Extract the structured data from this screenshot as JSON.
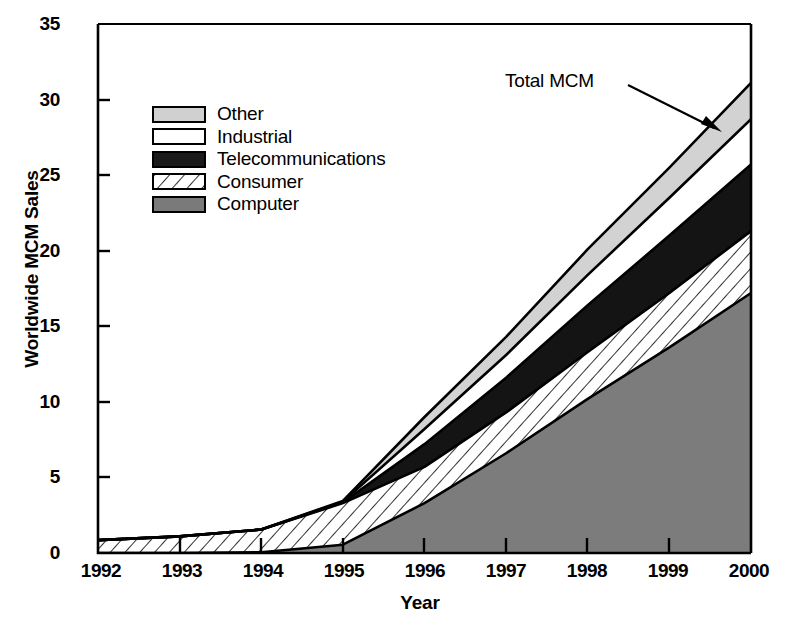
{
  "chart_data": {
    "type": "area",
    "stacked": true,
    "title": "",
    "xlabel": "Year",
    "ylabel": "Worldwide MCM Sales",
    "x": [
      1992,
      1993,
      1994,
      1995,
      1996,
      1997,
      1998,
      1999,
      2000
    ],
    "xtick_labels": [
      "1992",
      "1993",
      "1994",
      "1995",
      "1996",
      "1997",
      "1998",
      "1999",
      "2000"
    ],
    "ytick_labels": [
      "0",
      "5",
      "10",
      "15",
      "20",
      "25",
      "30",
      "35"
    ],
    "yticks": [
      0,
      5,
      10,
      15,
      20,
      25,
      30,
      35
    ],
    "ylim": [
      0,
      35
    ],
    "xlim": [
      1992,
      2000
    ],
    "grid": false,
    "legend_position": "upper-left-inside",
    "series": [
      {
        "name": "Computer",
        "swatch": "solid-gray",
        "color": "#7a7a7a",
        "values": [
          0.0,
          0.0,
          0.05,
          0.55,
          3.3,
          6.6,
          10.2,
          13.6,
          17.2
        ]
      },
      {
        "name": "Consumer",
        "swatch": "diagonal-hatch",
        "color": "#ffffff",
        "values": [
          0.85,
          1.1,
          1.5,
          2.75,
          2.4,
          2.7,
          3.1,
          3.6,
          4.1
        ]
      },
      {
        "name": "Telecommunications",
        "swatch": "solid-black",
        "color": "#1a1a1a",
        "values": [
          0.0,
          0.0,
          0.0,
          0.05,
          1.5,
          2.3,
          3.1,
          3.8,
          4.4
        ]
      },
      {
        "name": "Industrial",
        "swatch": "solid-white",
        "color": "#ffffff",
        "values": [
          0.0,
          0.0,
          0.0,
          0.05,
          1.0,
          1.5,
          2.0,
          2.5,
          3.0
        ]
      },
      {
        "name": "Other",
        "swatch": "light-gray",
        "color": "#d0d0d0",
        "values": [
          0.0,
          0.0,
          0.0,
          0.05,
          0.8,
          1.2,
          1.7,
          2.0,
          2.4
        ]
      }
    ],
    "cumulative_totals": {
      "Computer": [
        0.0,
        0.0,
        0.05,
        0.55,
        3.3,
        6.6,
        10.2,
        13.6,
        17.2
      ],
      "Consumer": [
        0.85,
        1.1,
        1.55,
        3.3,
        5.7,
        9.3,
        13.3,
        17.2,
        21.3
      ],
      "Telecommunications": [
        0.85,
        1.1,
        1.55,
        3.35,
        7.2,
        11.6,
        16.4,
        21.0,
        25.7
      ],
      "Industrial": [
        0.85,
        1.1,
        1.55,
        3.4,
        8.2,
        13.1,
        18.4,
        23.5,
        28.7
      ],
      "Other": [
        0.85,
        1.1,
        1.55,
        3.45,
        9.0,
        14.3,
        20.1,
        25.5,
        31.1
      ]
    },
    "annotations": [
      {
        "text": "Total MCM",
        "points_to_series": "Other",
        "points_to_x": 1999.6
      }
    ]
  },
  "axes": {
    "ylabel": "Worldwide MCM Sales",
    "xlabel": "Year"
  },
  "legend": {
    "items": [
      {
        "label": "Other"
      },
      {
        "label": "Industrial"
      },
      {
        "label": "Telecommunications"
      },
      {
        "label": "Consumer"
      },
      {
        "label": "Computer"
      }
    ]
  },
  "annotation": {
    "label": "Total MCM"
  }
}
